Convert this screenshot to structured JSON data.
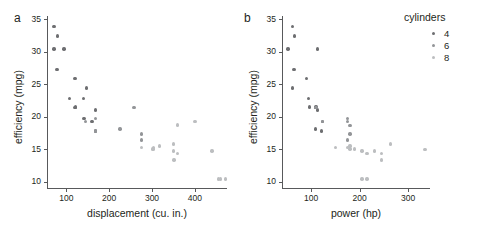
{
  "figure": {
    "background": "#ffffff",
    "panel_label_a": "a",
    "panel_label_b": "b"
  },
  "legend": {
    "title": "cylinders",
    "position": "top-right",
    "entries": [
      {
        "label": "4",
        "color": "#6d6e71"
      },
      {
        "label": "6",
        "color": "#939598"
      },
      {
        "label": "8",
        "color": "#bcbec0"
      }
    ]
  },
  "colors": {
    "cyl4": "#6d6e71",
    "cyl6": "#939598",
    "cyl8": "#bcbec0",
    "axis": "#58595b",
    "text": "#231f20"
  },
  "chart_data": [
    {
      "type": "scatter",
      "panel": "a",
      "title": "",
      "xlabel": "displacement (cu. in.)",
      "ylabel": "efficiency (mpg)",
      "xlim": [
        55,
        475
      ],
      "ylim": [
        9,
        35.5
      ],
      "xticks": [
        100,
        200,
        300,
        400
      ],
      "yticks": [
        10,
        15,
        20,
        25,
        30,
        35
      ],
      "grid": false,
      "legend_key": "cylinders",
      "series": [
        {
          "name": "4",
          "color": "#6d6e71",
          "points": [
            [
              71,
              33.9
            ],
            [
              79,
              32.4
            ],
            [
              71,
              30.4
            ],
            [
              95.1,
              30.4
            ],
            [
              78.7,
              27.3
            ],
            [
              120.1,
              25.9
            ],
            [
              146.7,
              24.4
            ],
            [
              108,
              22.8
            ],
            [
              140.8,
              22.8
            ],
            [
              120.3,
              21.4
            ],
            [
              121,
              21.5
            ],
            [
              167.6,
              21.0
            ],
            [
              141,
              19.7
            ],
            [
              160,
              19.2
            ],
            [
              167.6,
              17.8
            ]
          ]
        },
        {
          "name": "6",
          "color": "#939598",
          "points": [
            [
              258,
              21.4
            ],
            [
              225,
              18.1
            ],
            [
              145,
              19.2
            ],
            [
              168,
              19.7
            ],
            [
              275.8,
              17.3
            ],
            [
              275.8,
              16.4
            ],
            [
              167.6,
              17.8
            ]
          ]
        },
        {
          "name": "8",
          "color": "#bcbec0",
          "points": [
            [
              360,
              18.7
            ],
            [
              400,
              19.2
            ],
            [
              275.8,
              15.2
            ],
            [
              301,
              15.0
            ],
            [
              304,
              15.2
            ],
            [
              318,
              15.5
            ],
            [
              350,
              15.8
            ],
            [
              360,
              14.3
            ],
            [
              351,
              13.3
            ],
            [
              440,
              14.7
            ],
            [
              460,
              10.4
            ],
            [
              472,
              10.4
            ],
            [
              455,
              10.4
            ],
            [
              350,
              14.7
            ],
            [
              304,
              15.0
            ]
          ]
        }
      ]
    },
    {
      "type": "scatter",
      "panel": "b",
      "title": "",
      "xlabel": "power (hp)",
      "ylabel": "efficiency (mpg)",
      "xlim": [
        40,
        345
      ],
      "ylim": [
        9,
        35.5
      ],
      "xticks": [
        100,
        200,
        300
      ],
      "yticks": [
        10,
        15,
        20,
        25,
        30,
        35
      ],
      "grid": false,
      "legend_key": "cylinders",
      "series": [
        {
          "name": "4",
          "color": "#6d6e71",
          "points": [
            [
              62,
              33.9
            ],
            [
              66,
              32.4
            ],
            [
              52,
              30.4
            ],
            [
              113,
              30.4
            ],
            [
              65,
              27.3
            ],
            [
              91,
              25.9
            ],
            [
              62,
              24.4
            ],
            [
              95,
              22.8
            ],
            [
              97,
              21.5
            ],
            [
              109,
              21.4
            ],
            [
              113,
              21.0
            ],
            [
              109,
              18.1
            ],
            [
              110,
              21.5
            ],
            [
              123,
              19.2
            ],
            [
              121,
              17.8
            ]
          ]
        },
        {
          "name": "6",
          "color": "#939598",
          "points": [
            [
              175,
              19.7
            ],
            [
              175,
              19.2
            ],
            [
              180,
              18.6
            ],
            [
              180,
              17.3
            ],
            [
              175,
              16.4
            ],
            [
              110,
              21.4
            ],
            [
              123,
              19.2
            ]
          ]
        },
        {
          "name": "8",
          "color": "#bcbec0",
          "points": [
            [
              150,
              15.2
            ],
            [
              175,
              15.2
            ],
            [
              180,
              15.0
            ],
            [
              205,
              14.7
            ],
            [
              230,
              14.7
            ],
            [
              215,
              14.3
            ],
            [
              245,
              14.3
            ],
            [
              245,
              13.3
            ],
            [
              264,
              15.8
            ],
            [
              335,
              14.9
            ],
            [
              205,
              10.4
            ],
            [
              215,
              10.4
            ],
            [
              180,
              15.5
            ],
            [
              190,
              15.0
            ]
          ]
        }
      ]
    }
  ]
}
